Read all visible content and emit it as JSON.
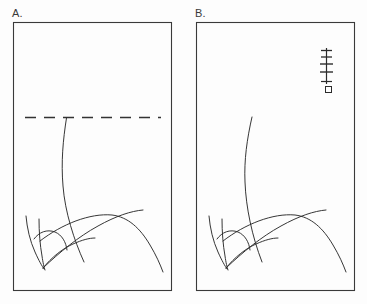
{
  "figure": {
    "background_color": "#fdfdfd",
    "ink_color": "#2b2b2b",
    "width": 367,
    "height": 304
  },
  "panels": [
    {
      "id": "A",
      "label": "A.",
      "frame": {
        "x": 13,
        "y": 22,
        "width": 159,
        "height": 269
      },
      "annotations": {
        "dashed_line": {
          "name": "cut-level-dashed-line",
          "y": 117,
          "x_start": 25,
          "x_end": 161,
          "dash_pattern": "9 7",
          "color": "#333333"
        }
      },
      "plant": {
        "description": "grass-like plant with one tall arcing stem rising to the dashed line and several curved leaves",
        "stem_top_y": 118,
        "leaf_count": 5
      }
    },
    {
      "id": "B",
      "label": "B.",
      "frame": {
        "x": 196,
        "y": 22,
        "width": 159,
        "height": 269
      },
      "annotations": {
        "scale_mark": {
          "name": "scale-bar-mark",
          "x": 326,
          "y_top": 48,
          "y_bottom": 84,
          "tick_count": 4,
          "color": "#2b2b2b"
        },
        "square_marker": {
          "name": "square-marker",
          "x": 325,
          "y": 86,
          "size": 6,
          "color": "#2b2b2b"
        }
      },
      "plant": {
        "description": "grass-like plant with one tall arcing stem extending above the level of panel A's dashed line and several curved leaves",
        "stem_top_y": 117,
        "leaf_count": 5
      }
    }
  ]
}
